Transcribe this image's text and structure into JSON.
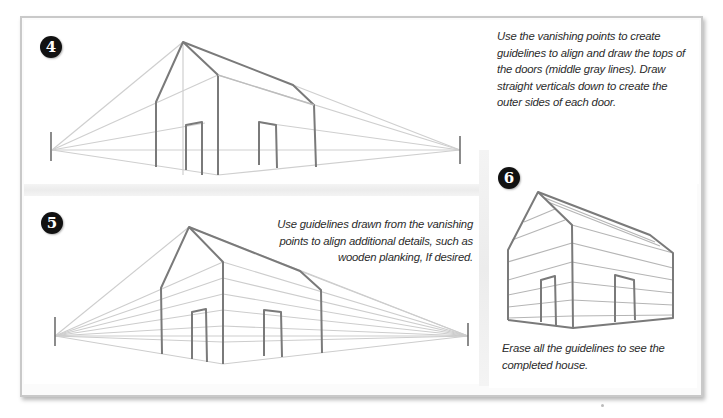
{
  "steps": [
    {
      "number": "4",
      "caption": "Use the vanishing points to create guidelines to align and draw the tops of the doors (middle gray lines). Draw straight verticals down to create the outer sides of each door."
    },
    {
      "number": "5",
      "caption": "Use guidelines drawn from the vanishing points to align additional details, such as wooden planking, If desired."
    },
    {
      "number": "6",
      "caption": "Erase all the guidelines to see the completed house."
    }
  ],
  "icons": {
    "badge": "numbered-step-badge",
    "vanishing_point": "vanishing-point-tick"
  },
  "colors": {
    "outline": "#7a7a7a",
    "guideline": "#c8c8c8",
    "badge": "#111111"
  }
}
